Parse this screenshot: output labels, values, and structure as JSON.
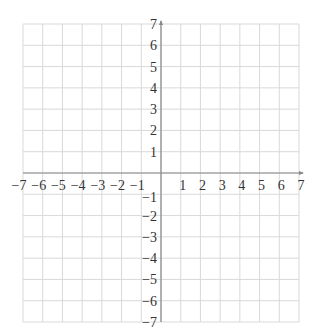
{
  "chart_data": {
    "type": "scatter",
    "title": "",
    "xlabel": "",
    "ylabel": "",
    "xlim": [
      -7,
      7
    ],
    "ylim": [
      -7,
      7
    ],
    "grid": true,
    "x_ticks": [
      "−7",
      "−6",
      "−5",
      "−4",
      "−3",
      "−2",
      "−1",
      "1",
      "2",
      "3",
      "4",
      "5",
      "6",
      "7"
    ],
    "y_ticks": [
      "7",
      "6",
      "5",
      "4",
      "3",
      "2",
      "1",
      "−1",
      "−2",
      "−3",
      "−4",
      "−5",
      "−6",
      "−7"
    ],
    "points": [],
    "legend": null
  },
  "colors": {
    "grid": "#d9d9d9",
    "axis": "#888888",
    "label": "#333333"
  }
}
